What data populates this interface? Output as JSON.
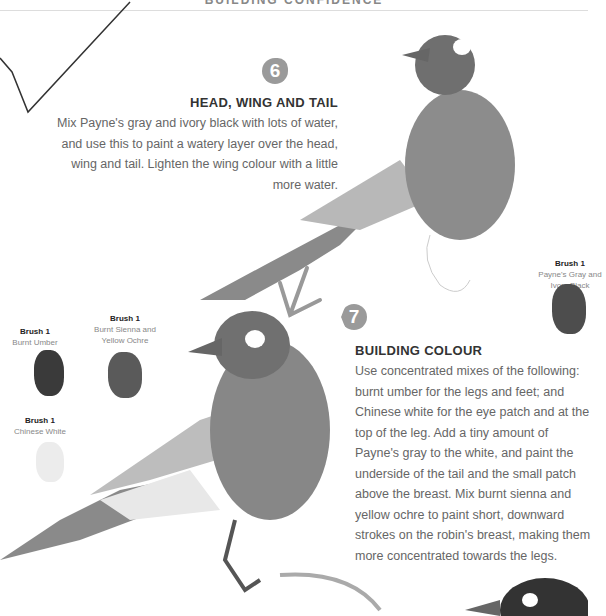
{
  "header": {
    "title": "BUILDING CONFIDENCE"
  },
  "steps": [
    {
      "number": "6",
      "title": "HEAD, WING AND TAIL",
      "text": "Mix Payne's gray and ivory black with lots of water, and use this to paint a watery layer over the head, wing and tail. Lighten the wing colour with a little more water."
    },
    {
      "number": "7",
      "title": "BUILDING COLOUR",
      "text": "Use concentrated mixes of the following: burnt umber for the legs and feet; and Chinese white for the eye patch and at the top of the leg. Add a tiny amount of Payne's gray to the white, and paint the underside of the tail and the small patch above the breast. Mix burnt sienna and yellow ochre to paint short, downward strokes on the robin's breast, making them more concentrated towards the legs."
    }
  ],
  "swatches": [
    {
      "brush": "Brush 1",
      "color_name": "Payne's Gray and Ivory Black",
      "color": "#4a4a4a"
    },
    {
      "brush": "Brush 1",
      "color_name": "Burnt Umber",
      "color": "#3a3a3a"
    },
    {
      "brush": "Brush 1",
      "color_name": "Burnt Sienna and Yellow Ochre",
      "color": "#5a5a5a"
    },
    {
      "brush": "Brush 1",
      "color_name": "Chinese White",
      "color": "#e6e6e6"
    }
  ]
}
